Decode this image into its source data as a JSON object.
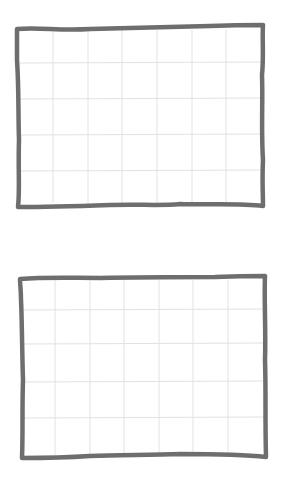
{
  "diagram": {
    "stroke_color": "#6e6e6e",
    "grid_color": "#e2e2e2",
    "background": "#ffffff",
    "panels": [
      {
        "id": "top-grid-panel",
        "columns": 7,
        "rows": 5,
        "x": 16,
        "y": 26,
        "width": 248,
        "height": 181
      },
      {
        "id": "bottom-grid-panel",
        "columns": 7,
        "rows": 5,
        "x": 19,
        "y": 277,
        "width": 247,
        "height": 182
      }
    ]
  }
}
